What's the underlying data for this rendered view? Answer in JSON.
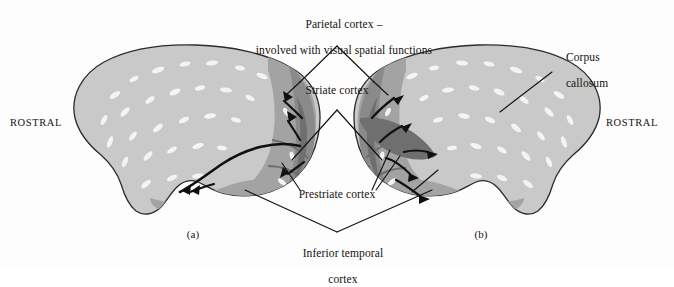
{
  "figure": {
    "background_color": "#fdfdfd",
    "ink_color": "#15120f"
  },
  "palette": {
    "cortex_light": "#c9c9c9",
    "cortex_light_edge": "#b6b6b6",
    "region_mid_gray": "#a3a3a3",
    "region_dark_gray": "#8a8a8a",
    "region_darkest_gray": "#6f6f6f",
    "speckle_highlight": "#f2f2f2",
    "outline": "#2b2b2b",
    "arrow": "#101010"
  },
  "labels": {
    "parietal": {
      "line1": "Parietal cortex –",
      "line2": "involved with visual spatial functions"
    },
    "striate": "Striate cortex",
    "prestriate": "Prestriate cortex",
    "inferior_temporal": {
      "line1": "Inferior temporal",
      "line2": "cortex"
    },
    "corpus_callosum": {
      "line1": "Corpus",
      "line2": "callosum"
    },
    "rostral_left": "ROSTRAL",
    "rostral_right": "ROSTRAL",
    "panel_a": "(a)",
    "panel_b": "(b)"
  },
  "panels": [
    {
      "id": "a",
      "caption": "(a)",
      "view": "lateral view of left hemisphere, occipital pole facing right",
      "regions": [
        "striate cortex",
        "prestriate cortex",
        "inferior temporal cortex",
        "parietal cortex"
      ],
      "pathway": "curved ventral stream arrow sweeping rostrally from occipital pole into temporal lobe, plus short dorsal arrows"
    },
    {
      "id": "b",
      "caption": "(b)",
      "view": "medial view of right hemisphere, occipital pole facing left",
      "regions": [
        "striate cortex",
        "prestriate cortex",
        "inferior temporal cortex",
        "corpus callosum"
      ],
      "pathway": "short arrows radiating from striate cortex into prestriate and inferior temporal cortex"
    }
  ],
  "leaders": {
    "parietal_targets": 2,
    "striate_targets": 2,
    "prestriate_targets": 4,
    "inferior_temporal_targets": 2,
    "corpus_callosum_targets": 1
  }
}
